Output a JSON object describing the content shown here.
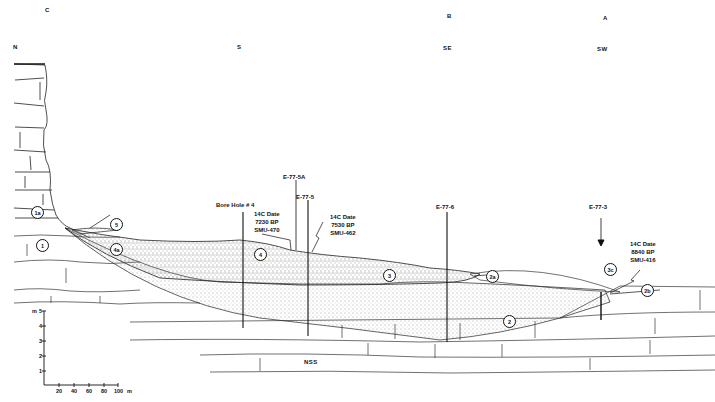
{
  "diagram": {
    "type": "geological-cross-section",
    "section_points": [
      {
        "id": "C",
        "label": "C",
        "x": 45,
        "y": 10
      },
      {
        "id": "B",
        "label": "B",
        "x": 447,
        "y": 16
      },
      {
        "id": "A",
        "label": "A",
        "x": 603,
        "y": 18
      }
    ],
    "orientations": [
      {
        "label": "N",
        "x": 13,
        "y": 46
      },
      {
        "label": "S",
        "x": 237,
        "y": 47
      },
      {
        "label": "SE",
        "x": 443,
        "y": 48
      },
      {
        "label": "SW",
        "x": 598,
        "y": 48
      }
    ],
    "boreholes": [
      {
        "label": "Bore Hole # 4",
        "x": 243
      },
      {
        "label": "E-77-5A",
        "x": 296
      },
      {
        "label": "E-77-5",
        "x": 308
      },
      {
        "label": "E-77-6",
        "x": 447
      },
      {
        "label": "E-77-3",
        "x": 601
      }
    ],
    "radiocarbon_dates": [
      {
        "header": "14C Date",
        "value": "7230 BP",
        "lab": "SMU-470"
      },
      {
        "header": "14C Date",
        "value": "7530 BP",
        "lab": "SMU-462"
      },
      {
        "header": "14C Date",
        "value": "8840 BP",
        "lab": "SMU-416"
      }
    ],
    "units": [
      {
        "id": "1",
        "label": "1"
      },
      {
        "id": "1a",
        "label": "1a"
      },
      {
        "id": "2",
        "label": "2"
      },
      {
        "id": "2a",
        "label": "2a"
      },
      {
        "id": "2b",
        "label": "2b"
      },
      {
        "id": "3",
        "label": "3"
      },
      {
        "id": "3c",
        "label": "3c"
      },
      {
        "id": "4",
        "label": "4"
      },
      {
        "id": "4a",
        "label": "4a"
      },
      {
        "id": "5",
        "label": "5"
      }
    ],
    "bedrock_label": "NSS",
    "scale": {
      "vertical_unit": "m",
      "vertical_ticks": [
        "1",
        "2",
        "3",
        "4",
        "5"
      ],
      "horizontal_unit": "m",
      "horizontal_ticks": [
        "20",
        "40",
        "60",
        "80",
        "100"
      ]
    }
  }
}
